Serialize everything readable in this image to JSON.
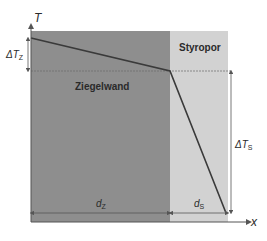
{
  "diagram": {
    "type": "temperature-profile",
    "axes": {
      "y_label": "T",
      "x_label": "x"
    },
    "layers": [
      {
        "name": "Ziegelwand",
        "color": "#8e8e8e",
        "thickness_label_main": "d",
        "thickness_label_sub": "Z"
      },
      {
        "name": "Styropor",
        "color": "#d2d2d2",
        "thickness_label_main": "d",
        "thickness_label_sub": "S"
      }
    ],
    "temperature_drops": [
      {
        "main": "ΔT",
        "sub": "Z"
      },
      {
        "main": "ΔT",
        "sub": "S"
      }
    ],
    "colors": {
      "brick": "#8e8e8e",
      "styropor": "#d2d2d2",
      "line": "#3a3a3a",
      "axis": "#555555"
    }
  }
}
